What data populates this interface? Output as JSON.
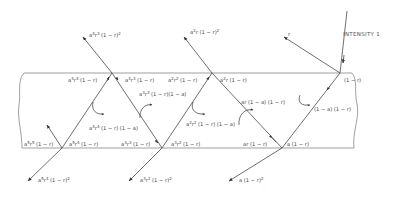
{
  "diagram": {
    "incident_label": "INTENSITY  1",
    "first_reflection_label": "r",
    "colors": {
      "line": "#4a4a4a",
      "text": "#444444",
      "slab": "#777777",
      "background": "#ffffff"
    },
    "upper_emerging_labels": [
      {
        "id": "a2r1-r2",
        "base": "a",
        "sup": "2",
        "mid": "r",
        "rest": " (1 − r)",
        "tail_sup": "2"
      },
      {
        "id": "a4r3-r2",
        "base": "a",
        "sup": "4",
        "mid": "r",
        "midsup": "3",
        "rest": " (1 − r)",
        "tail_sup": "2"
      }
    ],
    "lower_emerging_labels": [
      {
        "id": "a1-r2",
        "text": "a (1 − r)",
        "tail_sup": "2"
      },
      {
        "id": "a3r2",
        "base": "a",
        "sup": "3",
        "mid": "r",
        "midsup": "2",
        "rest": " (1 − r)",
        "tail_sup": "2"
      },
      {
        "id": "a5r4",
        "base": "a",
        "sup": "5",
        "mid": "r",
        "midsup": "4",
        "rest": " (1 − r)",
        "tail_sup": "2"
      }
    ],
    "internal_labels": {
      "top_right": "(1 − r)",
      "absorb1": "(1 − a) (1 − r)",
      "bottom_a": "a (1 − r)",
      "bottom_ar": "ar (1 − r)",
      "absorb2": "ar (1 − a) (1 − r)",
      "top_a2r_right": {
        "base": "a",
        "sup": "2",
        "mid": "r",
        "rest": " (1 − r)"
      },
      "top_a2r2_left": {
        "base": "a",
        "sup": "2",
        "mid": "r",
        "midsup": "2",
        "rest": " (1 − r)"
      },
      "absorb3": {
        "base": "a",
        "sup": "2",
        "mid": "r",
        "midsup": "2",
        "rest": " (1 − r) (1 − a)"
      },
      "bottom_a3r2_right": {
        "base": "a",
        "sup": "3",
        "mid": "r",
        "midsup": "2",
        "rest": " (1 − r)"
      },
      "bottom_a3r3_left": {
        "base": "a",
        "sup": "3",
        "mid": "r",
        "midsup": "3",
        "rest": " (1 − r)"
      },
      "absorb4": {
        "base": "a",
        "sup": "3",
        "mid": "r",
        "midsup": "3",
        "rest": " (1 − r)(1 − a)"
      },
      "top_a4r3_right": {
        "base": "a",
        "sup": "4",
        "mid": "r",
        "midsup": "3",
        "rest": " (1 − r)"
      },
      "top_a4r4_left": {
        "base": "a",
        "sup": "4",
        "mid": "r",
        "midsup": "4",
        "rest": " (1 − r)"
      },
      "absorb5": {
        "base": "a",
        "sup": "4",
        "mid": "r",
        "midsup": "4",
        "rest": " (1 − r) (1 − a)"
      },
      "bottom_a5r4_right": {
        "base": "a",
        "sup": "5",
        "mid": "r",
        "midsup": "4",
        "rest": " (1 − r)"
      },
      "bottom_a5r5_left": {
        "base": "a",
        "sup": "5",
        "mid": "r",
        "midsup": "5",
        "rest": " (1 − r)"
      }
    }
  }
}
